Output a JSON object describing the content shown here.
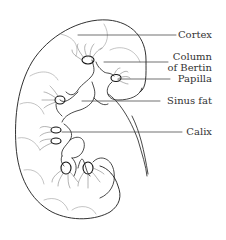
{
  "diagram": {
    "stroke_color": "#1a1a1a",
    "leader_color": "#333333",
    "labels": [
      {
        "id": "cortex",
        "text": "Cortex",
        "line_y": 35
      },
      {
        "id": "column-of-bertin",
        "line1": "Column",
        "line2": "of Bertin",
        "line_y": 62
      },
      {
        "id": "papilla",
        "text": "Papilla",
        "line_y": 79
      },
      {
        "id": "sinus-fat",
        "text": "Sinus fat",
        "line_y": 101
      },
      {
        "id": "calix",
        "text": "Calix",
        "line_y": 132
      }
    ]
  }
}
